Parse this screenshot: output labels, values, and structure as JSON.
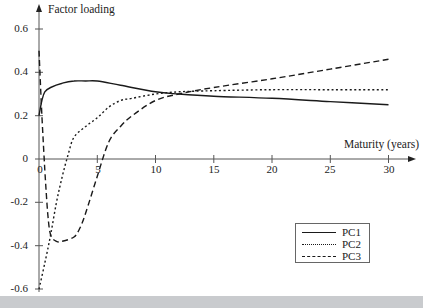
{
  "chart_data": {
    "type": "line",
    "title": "",
    "xlabel": "Maturity (years)",
    "ylabel": "Factor loading",
    "xlim": [
      0,
      32
    ],
    "ylim": [
      -0.6,
      0.65
    ],
    "x_ticks": [
      0,
      5,
      10,
      15,
      20,
      25,
      30
    ],
    "y_ticks": [
      -0.6,
      -0.4,
      -0.2,
      0,
      0.2,
      0.4,
      0.6
    ],
    "x_tick_labels": [
      "0",
      "5",
      "10",
      "15",
      "20",
      "25",
      "30"
    ],
    "y_tick_labels": [
      "-0.6",
      "-0.4",
      "-0.2",
      "0",
      "0.2",
      "0.4",
      "0.6"
    ],
    "grid": false,
    "legend_position": "lower right",
    "series": [
      {
        "name": "PC1",
        "style": "solid",
        "x": [
          0,
          0.25,
          0.5,
          1,
          2,
          3,
          4,
          5,
          7,
          10,
          12,
          15,
          20,
          25,
          30
        ],
        "values": [
          0.2,
          0.27,
          0.31,
          0.33,
          0.35,
          0.36,
          0.36,
          0.36,
          0.34,
          0.31,
          0.3,
          0.29,
          0.28,
          0.265,
          0.25
        ]
      },
      {
        "name": "PC2",
        "style": "dotted",
        "x": [
          0,
          0.5,
          1,
          1.5,
          2,
          2.5,
          3,
          4,
          5,
          6,
          7,
          8,
          10,
          12,
          15,
          20,
          25,
          30
        ],
        "values": [
          -0.6,
          -0.48,
          -0.35,
          -0.2,
          -0.08,
          0.02,
          0.1,
          0.15,
          0.19,
          0.24,
          0.27,
          0.28,
          0.3,
          0.31,
          0.315,
          0.32,
          0.32,
          0.32
        ]
      },
      {
        "name": "PC3",
        "style": "dashed",
        "x": [
          0,
          0.25,
          0.5,
          0.75,
          1,
          1.5,
          2,
          3,
          3.5,
          4,
          5,
          6,
          7,
          8,
          10,
          12,
          15,
          20,
          25,
          30
        ],
        "values": [
          0.5,
          0.2,
          -0.05,
          -0.25,
          -0.35,
          -0.38,
          -0.38,
          -0.36,
          -0.32,
          -0.25,
          -0.08,
          0.08,
          0.15,
          0.2,
          0.27,
          0.3,
          0.33,
          0.37,
          0.415,
          0.46
        ]
      }
    ]
  },
  "axes": {
    "y_title": "Factor loading",
    "x_title": "Maturity (years)",
    "y_ticks": [
      "0.6",
      "0.4",
      "0.2",
      "0",
      "-0.2",
      "-0.4",
      "-0.6"
    ],
    "x_ticks": [
      "0",
      "5",
      "10",
      "15",
      "20",
      "25",
      "30"
    ]
  },
  "legend": {
    "items": [
      {
        "label": "PC1",
        "style": "solid"
      },
      {
        "label": "PC2",
        "style": "dotted"
      },
      {
        "label": "PC3",
        "style": "dashed"
      }
    ]
  },
  "colors": {
    "line": "#1a1a1a",
    "axis": "#555555",
    "footer_band": "#c9cbce"
  }
}
